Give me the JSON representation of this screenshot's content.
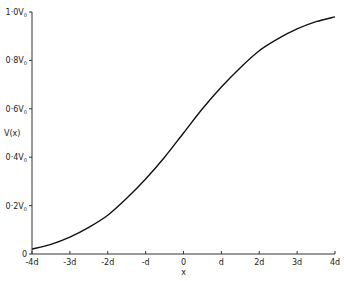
{
  "chart_data": {
    "type": "line",
    "title": "",
    "xlabel": "x",
    "ylabel": "V(x)",
    "x_ticks": [
      "-4d",
      "-3d",
      "-2d",
      "-d",
      "0",
      "d",
      "2d",
      "3d",
      "4d"
    ],
    "y_ticks": [
      "0",
      "0·2V0",
      "0·4V0",
      "0·6V0",
      "0·8V0",
      "1·0V0"
    ],
    "xlim": [
      -4,
      4
    ],
    "ylim": [
      0,
      1.0
    ],
    "grid": false,
    "series": [
      {
        "name": "V(x)",
        "x": [
          -4,
          -3.5,
          -3,
          -2.5,
          -2,
          -1.5,
          -1,
          -0.5,
          0,
          0.5,
          1,
          1.5,
          2,
          2.5,
          3,
          3.5,
          4
        ],
        "values": [
          0.02,
          0.04,
          0.07,
          0.11,
          0.16,
          0.23,
          0.31,
          0.4,
          0.5,
          0.6,
          0.69,
          0.77,
          0.84,
          0.89,
          0.93,
          0.96,
          0.98
        ]
      }
    ]
  }
}
